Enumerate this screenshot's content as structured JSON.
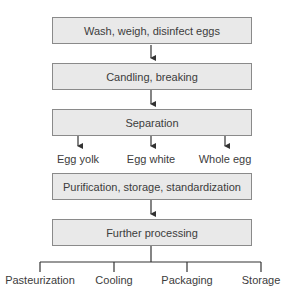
{
  "diagram": {
    "type": "flowchart",
    "steps": [
      {
        "label": "Wash, weigh, disinfect eggs"
      },
      {
        "label": "Candling, breaking"
      },
      {
        "label": "Separation"
      },
      {
        "label": "Purification, storage, standardization"
      },
      {
        "label": "Further processing"
      }
    ],
    "separation_outputs": [
      {
        "label": "Egg yolk"
      },
      {
        "label": "Egg white"
      },
      {
        "label": "Whole egg"
      }
    ],
    "processing_outputs": [
      {
        "label": "Pasteurization"
      },
      {
        "label": "Cooling"
      },
      {
        "label": "Packaging"
      },
      {
        "label": "Storage"
      }
    ],
    "colors": {
      "box_fill": "#e9e9e9",
      "box_border": "#8a8a8a",
      "line": "#333333",
      "text": "#3c3c3c"
    }
  }
}
